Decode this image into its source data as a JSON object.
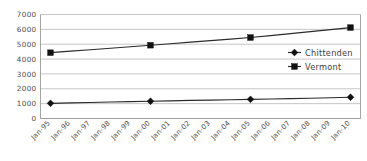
{
  "chart_data": {
    "type": "line",
    "title": "",
    "xlabel": "",
    "ylabel": "",
    "categories": [
      "Jan-95",
      "Jan-96",
      "Jan-97",
      "Jan-98",
      "Jan-99",
      "Jan-00",
      "Jan-01",
      "Jan-02",
      "Jan-03",
      "Jan-04",
      "Jan-05",
      "Jan-06",
      "Jan-07",
      "Jan-08",
      "Jan-09",
      "Jan-10"
    ],
    "series": [
      {
        "name": "Chittenden",
        "marker": "diamond",
        "color": "#111111",
        "values": [
          1020,
          1050,
          1080,
          1110,
          1135,
          1160,
          1190,
          1215,
          1240,
          1265,
          1290,
          1315,
          1340,
          1365,
          1400,
          1430
        ]
      },
      {
        "name": "Vermont",
        "marker": "square",
        "color": "#111111",
        "values": [
          4430,
          4530,
          4630,
          4730,
          4830,
          4930,
          5030,
          5140,
          5240,
          5345,
          5450,
          5580,
          5710,
          5845,
          5980,
          6120
        ]
      }
    ],
    "marker_interval": 5,
    "ylim": [
      0,
      7000
    ],
    "yticks": [
      0,
      1000,
      2000,
      3000,
      4000,
      5000,
      6000,
      7000
    ],
    "ytick_labels": [
      "0",
      "1000",
      "2000",
      "3000",
      "4000",
      "5000",
      "6000",
      "7000"
    ],
    "grid": true,
    "legend_position": "center-right",
    "xtick_rotation": -45
  },
  "legend": {
    "items": [
      {
        "label": "Chittenden",
        "marker": "diamond-icon"
      },
      {
        "label": "Vermont",
        "marker": "square-icon"
      }
    ]
  },
  "colors": {
    "gridline": "#b8b8b8",
    "axis": "#9a9a9a",
    "series": "#2b2b2b",
    "marker": "#111111",
    "tick_label": "#4d4d4d",
    "legend_label": "#3d3d3d",
    "background": "#ffffff"
  }
}
